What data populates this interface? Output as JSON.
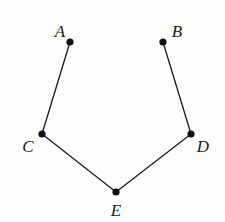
{
  "diagram": {
    "type": "geometry-figure",
    "points": [
      {
        "id": "A",
        "label": "A",
        "x": 70,
        "y": 42,
        "lx": 60,
        "ly": 37
      },
      {
        "id": "B",
        "label": "B",
        "x": 163,
        "y": 42,
        "lx": 177,
        "ly": 37
      },
      {
        "id": "C",
        "label": "C",
        "x": 42,
        "y": 134,
        "lx": 28,
        "ly": 152
      },
      {
        "id": "D",
        "label": "D",
        "x": 191,
        "y": 134,
        "lx": 203,
        "ly": 152
      },
      {
        "id": "E",
        "label": "E",
        "x": 116,
        "y": 192,
        "lx": 116,
        "ly": 216
      }
    ],
    "segments": [
      [
        "A",
        "C"
      ],
      [
        "C",
        "E"
      ],
      [
        "E",
        "D"
      ],
      [
        "D",
        "B"
      ]
    ],
    "colors": {
      "line": "#1a1a1a",
      "point": "#111111",
      "background": "#fdfdfb"
    }
  }
}
